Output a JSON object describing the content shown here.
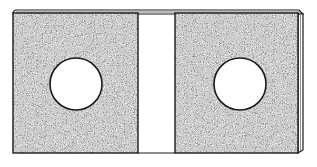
{
  "illustration": {
    "title": "Slab with two circular holes",
    "panels": [
      {
        "name": "left-panel",
        "has_hole": true
      },
      {
        "name": "right-panel",
        "has_hole": true
      }
    ],
    "colors": {
      "background": "#ffffff",
      "outline": "#1a1a1a",
      "texture_dark": "#2b2b2b",
      "texture_light": "#d8d8d8",
      "hole_fill": "#ffffff"
    }
  }
}
